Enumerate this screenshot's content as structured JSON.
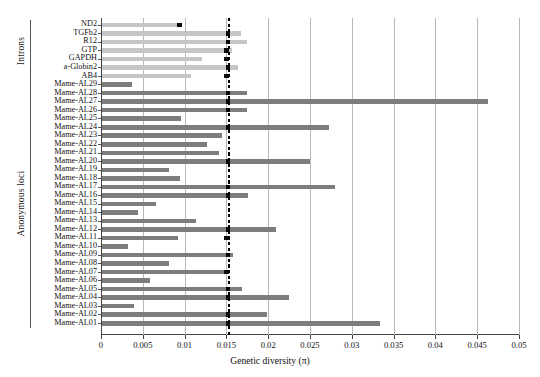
{
  "chart_data": {
    "type": "bar",
    "title": "",
    "xlabel": "Genetic diversity (π)",
    "ylabel": "",
    "orientation": "horizontal",
    "xlim": [
      0,
      0.05
    ],
    "grid": true,
    "legend": false,
    "xticks": [
      "0",
      "0.005",
      "0.01",
      "0.015",
      "0.02",
      "0.025",
      "0.03",
      "0.035",
      "0.04",
      "0.045",
      "0.05"
    ],
    "xtick_values": [
      0,
      0.005,
      0.01,
      0.015,
      0.02,
      0.025,
      0.03,
      0.035,
      0.04,
      0.045,
      0.05
    ],
    "reference_line": {
      "label": "",
      "value": 0.0153,
      "style": "dashed",
      "color": "#000000"
    },
    "groups": [
      {
        "name": "Introns",
        "color": "#c6c6c6",
        "categories": [
          "ND2",
          "TGFb2",
          "R12",
          "GTP",
          "GAPDH",
          "a-Globin2",
          "AB4"
        ],
        "values": [
          0.0094,
          0.0166,
          0.0174,
          0.0155,
          0.012,
          0.0163,
          0.0107
        ],
        "medians": [
          0.0094,
          0.0152,
          0.0152,
          0.015,
          0.015,
          0.0152,
          0.015
        ]
      },
      {
        "name": "Anonymous loci",
        "color": "#7d7d7d",
        "categories": [
          "Mame-AL29",
          "Mame-AL28",
          "Mame-AL27",
          "Mame-AL26",
          "Mame-AL25",
          "Mame-AL24",
          "Mame-AL23",
          "Mame-AL22",
          "Mame-AL21",
          "Mame-AL20",
          "Mame-AL19",
          "Mame-AL18",
          "Mame-AL17",
          "Mame-AL16",
          "Mame-AL15",
          "Mame-AL14",
          "Mame-AL13",
          "Mame-AL12",
          "Mame-AL11",
          "Mame-AL10",
          "Mame-AL09",
          "Mame-AL08",
          "Mame-AL07",
          "Mame-AL06",
          "Mame-AL05",
          "Mame-AL04",
          "Mame-AL03",
          "Mame-AL02",
          "Mame-AL01"
        ],
        "values": [
          0.0036,
          0.0174,
          0.0462,
          0.0174,
          0.0095,
          0.0272,
          0.0143,
          0.0126,
          0.014,
          0.0249,
          0.008,
          0.0093,
          0.0279,
          0.0175,
          0.0064,
          0.0043,
          0.0113,
          0.0208,
          0.0091,
          0.0031,
          0.0157,
          0.008,
          0.015,
          0.0058,
          0.0167,
          0.0224,
          0.0038,
          0.0197,
          0.0332
        ],
        "medians": [
          null,
          0.0152,
          0.0152,
          0.0152,
          null,
          0.0152,
          null,
          null,
          null,
          0.0152,
          null,
          null,
          0.0152,
          0.0152,
          null,
          null,
          null,
          0.0152,
          0.015,
          null,
          0.0152,
          null,
          0.015,
          null,
          0.0152,
          0.0152,
          null,
          0.0152,
          0.0152
        ]
      }
    ]
  }
}
